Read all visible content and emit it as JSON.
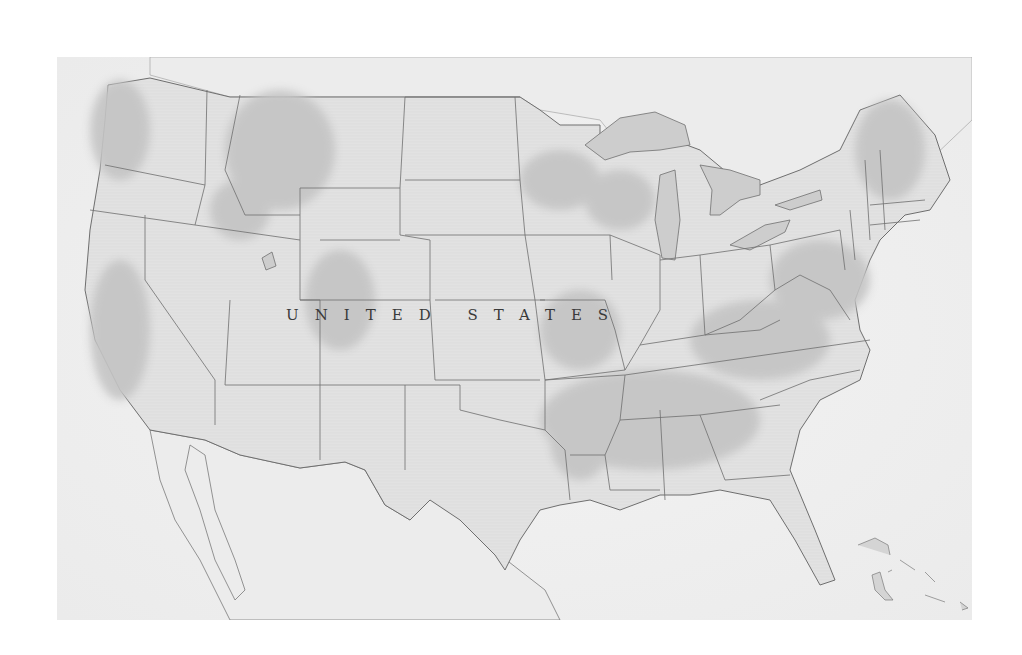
{
  "map": {
    "label": "UNITED STATES",
    "style": "grayscale shaded relief",
    "colors": {
      "ocean": "#f1f1f1",
      "land": "#e4e4e4",
      "relief_dark": "#c2c2c2",
      "relief_mid": "#d2d2d2",
      "borders": "#6e6e6e",
      "water": "#c9c9c9",
      "background": "#ffffff"
    },
    "features": [
      "Contiguous United States state boundaries",
      "Great Lakes",
      "Northern Mexico and Baja California",
      "Gulf of Mexico coastline",
      "Bahamas islands",
      "Southern Canada"
    ]
  }
}
